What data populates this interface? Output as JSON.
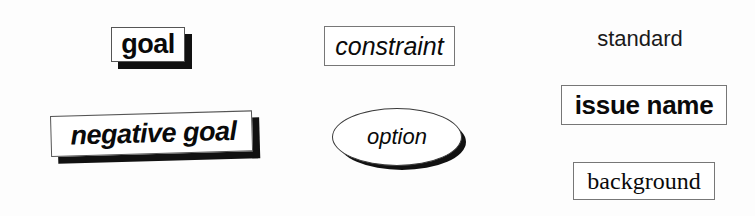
{
  "diagram": {
    "background_color": "#fdfdfd",
    "ink_color": "#0a0a0a",
    "shadow_color": "#111111",
    "border_color": "#4a4a4a"
  },
  "nodes": {
    "goal": {
      "label": "goal",
      "shape": "rectangle",
      "style": "bold sans-serif, drop shadow",
      "has_shadow": true
    },
    "negative_goal": {
      "label": "negative goal",
      "shape": "rectangle",
      "style": "bold italic sans-serif, rotated, drop shadow",
      "has_shadow": true,
      "rotation_deg": -1.6
    },
    "constraint": {
      "label": "constraint",
      "shape": "rectangle",
      "style": "italic sans-serif",
      "has_shadow": false
    },
    "option": {
      "label": "option",
      "shape": "ellipse",
      "style": "italic sans-serif, drop shadow",
      "has_shadow": true
    },
    "standard": {
      "label": "standard",
      "shape": "none",
      "style": "plain sans-serif text",
      "has_shadow": false
    },
    "issue_name": {
      "label": "issue name",
      "shape": "rectangle",
      "style": "bold sans-serif",
      "has_shadow": false
    },
    "background": {
      "label": "background",
      "shape": "rectangle",
      "style": "serif",
      "has_shadow": false
    }
  }
}
